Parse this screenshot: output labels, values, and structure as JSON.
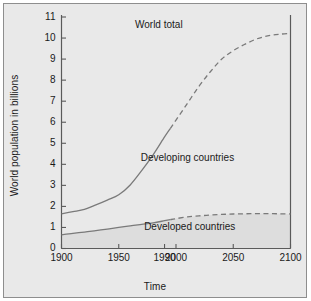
{
  "chart_data": {
    "type": "line",
    "title": "",
    "xlabel": "Time",
    "ylabel": "World population in billions",
    "xlim": [
      1900,
      2100
    ],
    "ylim": [
      0,
      11
    ],
    "grid": false,
    "legend_position": "inline-annotations",
    "xticks": [
      "1900",
      "1950",
      "1990",
      "2000",
      "2050",
      "2100"
    ],
    "xtick_values": [
      1900,
      1950,
      1990,
      2000,
      2050,
      2100
    ],
    "yticks": [
      "0",
      "1",
      "2",
      "3",
      "4",
      "5",
      "6",
      "7",
      "8",
      "9",
      "10",
      "11"
    ],
    "ytick_values": [
      0,
      1,
      2,
      3,
      4,
      5,
      6,
      7,
      8,
      9,
      10,
      11
    ],
    "annotations": [
      {
        "text": "World total",
        "x": 1985,
        "y": 10.6
      },
      {
        "text": "Developing countries",
        "x": 2010,
        "y": 4.3
      },
      {
        "text": "Developed countries",
        "x": 2012,
        "y": 1.0
      }
    ],
    "series": [
      {
        "name": "World total",
        "style": "solid-then-dashed",
        "split_year": 1995,
        "x": [
          1900,
          1910,
          1920,
          1930,
          1940,
          1950,
          1960,
          1970,
          1980,
          1990,
          1995,
          2000,
          2010,
          2020,
          2030,
          2040,
          2050,
          2060,
          2070,
          2080,
          2090,
          2100
        ],
        "values": [
          1.65,
          1.75,
          1.86,
          2.07,
          2.3,
          2.55,
          3.02,
          3.7,
          4.45,
          5.3,
          5.7,
          6.1,
          6.9,
          7.7,
          8.4,
          9.0,
          9.4,
          9.7,
          9.95,
          10.1,
          10.18,
          10.22
        ]
      },
      {
        "name": "Developed countries",
        "style": "solid-then-dashed",
        "split_year": 1995,
        "x": [
          1900,
          1910,
          1920,
          1930,
          1940,
          1950,
          1960,
          1970,
          1980,
          1990,
          1995,
          2000,
          2010,
          2020,
          2030,
          2040,
          2050,
          2060,
          2070,
          2080,
          2090,
          2100
        ],
        "values": [
          0.65,
          0.72,
          0.78,
          0.85,
          0.92,
          1.0,
          1.08,
          1.15,
          1.22,
          1.32,
          1.37,
          1.42,
          1.5,
          1.55,
          1.59,
          1.62,
          1.64,
          1.65,
          1.66,
          1.66,
          1.65,
          1.64
        ]
      }
    ],
    "derived_region": {
      "name": "Developing countries",
      "description": "Area between the Developed countries curve and the World total curve"
    },
    "colors": {
      "background": "#e9e9e9",
      "curve": "#7a7a7a",
      "developed_fill": "#dcdcdc",
      "axis": "#5a5a5a",
      "text": "#1a1a1a",
      "frame": "#8e8e8e"
    }
  }
}
